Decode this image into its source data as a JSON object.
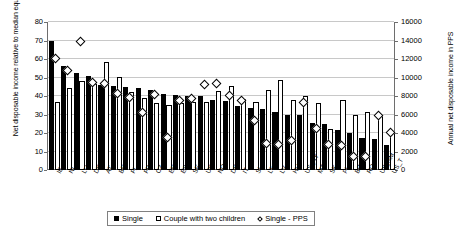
{
  "chart_data": {
    "type": "bar",
    "title": "",
    "xlabel": "",
    "ylabel": "Net disposable income relative to median equivalent household income",
    "ylabel_secondary": "Annual net disposable income in PPS",
    "ylim": [
      0,
      80
    ],
    "ylim_secondary": [
      0,
      16000
    ],
    "yticks": [
      0,
      10,
      20,
      30,
      40,
      50,
      60,
      70,
      80
    ],
    "yticks_secondary": [
      0,
      2000,
      4000,
      6000,
      8000,
      10000,
      12000,
      14000,
      16000
    ],
    "grid": true,
    "legend_position": "bottom",
    "categories": [
      "IE",
      "NL",
      "LU",
      "DK",
      "AT",
      "BE",
      "FI",
      "FR",
      "CZ",
      "EE",
      "ES",
      "SE",
      "UK",
      "NO",
      "DE",
      "IT",
      "SI",
      "LT",
      "LV",
      "HU",
      "US_NY",
      "MT",
      "SK",
      "PL",
      "BG",
      "RO",
      "US_NM",
      "US_T"
    ],
    "series": [
      {
        "name": "Single",
        "axis": "left",
        "values": [
          70.0,
          56.0,
          52.2,
          50.8,
          46.0,
          45.6,
          44.8,
          44.2,
          43.0,
          41.2,
          40.3,
          40.2,
          40.1,
          37.6,
          37.2,
          34.8,
          33.4,
          33.0,
          31.6,
          30.0,
          29.8,
          25.4,
          24.8,
          21.5,
          19.8,
          17.3,
          16.8,
          13.5
        ]
      },
      {
        "name": "Couple with two children",
        "axis": "left",
        "values": [
          36.6,
          44.4,
          48.2,
          46.4,
          58.2,
          50.4,
          42.4,
          39.0,
          36.0,
          35.4,
          36.4,
          36.8,
          37.0,
          42.6,
          45.4,
          38.6,
          36.8,
          43.0,
          48.4,
          37.6,
          40.0,
          36.2,
          22.3,
          37.8,
          29.6,
          31.4,
          29.8,
          20.4
        ]
      },
      {
        "name": "Single - PPS",
        "axis": "right",
        "type": "scatter",
        "values": [
          11900,
          10600,
          13800,
          9300,
          9200,
          8200,
          7700,
          6100,
          8100,
          3400,
          7400,
          7600,
          9100,
          9200,
          7900,
          7400,
          5200,
          2800,
          2600,
          3100,
          7200,
          4400,
          2700,
          2500,
          1400,
          1400,
          5800,
          3900
        ]
      }
    ],
    "legend": [
      "Single",
      "Couple with two children",
      "Single - PPS"
    ]
  }
}
